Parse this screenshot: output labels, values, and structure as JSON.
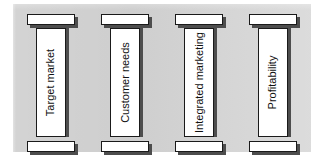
{
  "figure": {
    "background_color": "#d3d3d3",
    "column_fill": "#ffffff",
    "column_border": "#1a1a1a",
    "shadow_color": "#4d4d4d"
  },
  "columns": [
    {
      "label": "Target market"
    },
    {
      "label": "Customer needs"
    },
    {
      "label": "Integrated marketing"
    },
    {
      "label": "Profitability"
    }
  ]
}
